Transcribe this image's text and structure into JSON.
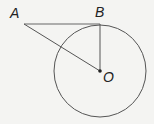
{
  "diagram": {
    "type": "geometry",
    "points": {
      "A": {
        "label": "A",
        "x": 24,
        "y": 24
      },
      "B": {
        "label": "B",
        "x": 100,
        "y": 24
      },
      "O": {
        "label": "O",
        "x": 100,
        "y": 71
      }
    },
    "circle": {
      "center": "O",
      "radius": 46
    },
    "segments": [
      [
        "A",
        "B"
      ],
      [
        "A",
        "O"
      ],
      [
        "B",
        "O"
      ]
    ],
    "colors": {
      "line": "#555555",
      "background": "#f4f4f2"
    }
  }
}
